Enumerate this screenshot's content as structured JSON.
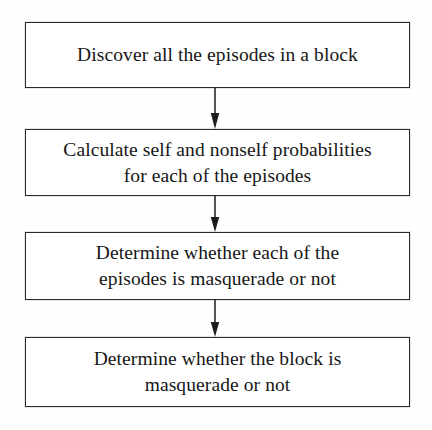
{
  "diagram": {
    "type": "flowchart",
    "orientation": "top-to-bottom",
    "background_color": "#fefefe",
    "border_color": "#2a2a2a",
    "text_color": "#161616",
    "nodes": [
      {
        "id": "node-1",
        "shape": "rectangle",
        "label": "Discover all the episodes in a block"
      },
      {
        "id": "node-2",
        "shape": "rectangle",
        "label": "Calculate self and nonself probabilities\nfor each of the episodes"
      },
      {
        "id": "node-3",
        "shape": "rectangle",
        "label": "Determine whether each of the\nepisodes is masquerade or not"
      },
      {
        "id": "node-4",
        "shape": "rectangle",
        "label": "Determine whether the block is\nmasquerade or not"
      }
    ],
    "connectors": [
      {
        "id": "connector-1",
        "from": "node-1",
        "to": "node-2",
        "style": "arrow-down"
      },
      {
        "id": "connector-2",
        "from": "node-2",
        "to": "node-3",
        "style": "arrow-down"
      },
      {
        "id": "connector-3",
        "from": "node-3",
        "to": "node-4",
        "style": "arrow-down"
      }
    ]
  }
}
